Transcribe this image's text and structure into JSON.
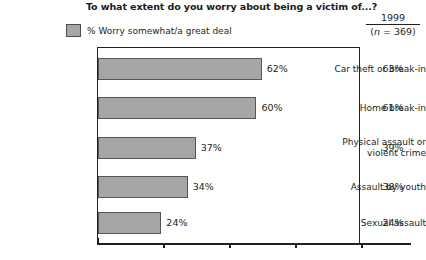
{
  "chart_data": {
    "type": "bar",
    "title": "To what extent do you worry about being a victim of...?",
    "orientation": "horizontal",
    "xlabel": "",
    "ylabel": "",
    "xlim": [
      0,
      100
    ],
    "grid": false,
    "legend": {
      "position": "top-left",
      "entries": [
        {
          "label": "% Worry somewhat/a great deal",
          "color": "#a6a6a6"
        }
      ]
    },
    "axis_ticks": [
      0,
      25,
      50,
      75,
      100
    ],
    "categories": [
      "Car theft or break-in",
      "Home break-in",
      "Physical assault or violent crime",
      "Assault by youth",
      "Sexual assault"
    ],
    "category_lines": [
      [
        "Car theft or break-in"
      ],
      [
        "Home break-in"
      ],
      [
        "Physical assault or",
        "violent crime"
      ],
      [
        "Assault by youth"
      ],
      [
        "Sexual assault"
      ]
    ],
    "values": [
      62,
      60,
      37,
      34,
      24
    ],
    "value_labels": [
      "62%",
      "60%",
      "37%",
      "34%",
      "24%"
    ],
    "series": [
      {
        "name": "% Worry somewhat/a great deal",
        "values": [
          62,
          60,
          37,
          34,
          24
        ]
      },
      {
        "name": "1999 (n = 369)",
        "values": [
          63,
          61,
          39,
          38,
          24
        ],
        "labels": [
          "63%",
          "61%",
          "39%",
          "38%",
          "24%"
        ],
        "display": "table-column"
      }
    ],
    "colors": {
      "bar_fill": "#a6a6a6",
      "bar_border": "#555555",
      "frame": "#231f20",
      "text": "#231f20"
    }
  },
  "column_header": {
    "year": "1999",
    "n_prefix": "(",
    "n_italic": "n",
    "n_suffix": " = 369)"
  },
  "footnote": {
    "text": ""
  }
}
